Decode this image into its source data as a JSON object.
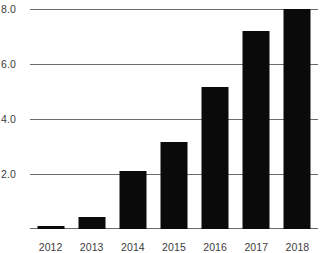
{
  "chart_data": {
    "type": "bar",
    "title": "",
    "xlabel": "",
    "ylabel": "",
    "categories": [
      "2012",
      "2013",
      "2014",
      "2015",
      "2016",
      "2017",
      "2018"
    ],
    "values": [
      0.1,
      0.45,
      2.1,
      3.15,
      5.15,
      7.2,
      8.0
    ],
    "series": [
      {
        "name": "",
        "values": [
          0.1,
          0.45,
          2.1,
          3.15,
          5.15,
          7.2,
          8.0
        ]
      }
    ],
    "ylim": [
      0,
      8.0
    ],
    "yticks": [
      2.0,
      4.0,
      6.0,
      8.0
    ],
    "ytick_labels": [
      "2.0",
      "4.0",
      "6.0",
      "8.0"
    ],
    "grid": true,
    "legend": false,
    "bar_color": "#0a0a0a",
    "grid_color": "#6b6b6b",
    "text_color": "#3c3c3c",
    "background_color": "#ffffff"
  }
}
